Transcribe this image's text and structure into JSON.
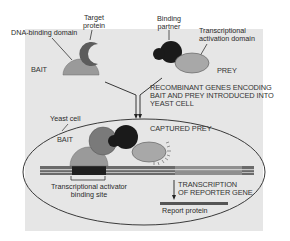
{
  "diagram": {
    "type": "yeast-two-hybrid-schematic",
    "colors": {
      "panel": "#e6e6e6",
      "bait_domain": "#9a9a9a",
      "target_protein": "#5c5c5c",
      "binding_partner": "#1a1a1a",
      "activation_domain": "#a8a8a8",
      "cell_outline": "#3a3a3a",
      "dna_strip": "#555555",
      "dna_dark_segment": "#1f1f1f",
      "reporter_gene_segment": "#8a8a8a"
    },
    "labels": {
      "dna_binding_domain": "DNA-binding domain",
      "target_protein_line1": "Target",
      "target_protein_line2": "protein",
      "binding_partner_line1": "Binding",
      "binding_partner_line2": "partner",
      "activation_domain_line1": "Transcriptional",
      "activation_domain_line2": "activation domain",
      "bait_top": "BAIT",
      "prey_top": "PREY",
      "recombinant_line1": "RECOMBINANT GENES ENCODING",
      "recombinant_line2": "BAIT AND PREY INTRODUCED INTO",
      "recombinant_line3": "YEAST CELL",
      "yeast_cell": "Yeast cell",
      "bait_inside": "BAIT",
      "captured_prey": "CAPTURED PREY",
      "activator_site_line1": "Transcriptional activator",
      "activator_site_line2": "binding site",
      "transcription_line1": "TRANSCRIPTION",
      "transcription_line2": "OF REPORTER GENE",
      "report_protein": "Report protein"
    }
  }
}
